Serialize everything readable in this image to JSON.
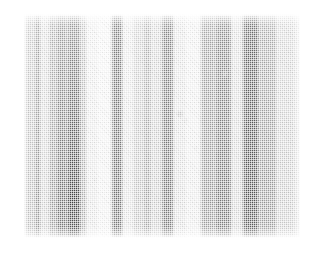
{
  "page": {
    "background_color": "#ffffff",
    "width": 315,
    "height": 265
  },
  "figure": {
    "kind": "scanned-gel-plate",
    "plate": {
      "x": 24,
      "y": 14,
      "width": 276,
      "height": 224,
      "paper_color": "#ffffff",
      "max_density_color": "#4a4a4a"
    },
    "texture": {
      "halftone": "orthogonal-dither-dot-screen",
      "dot_pitch_px": 2,
      "grain": "diagonal-cross-mottle",
      "streaking": "horizontal-scan-lines"
    }
  },
  "chart_data": {
    "type": "heatmap",
    "title": "",
    "subtitle": "",
    "xlabel": "",
    "ylabel": "",
    "orientation": "vertical-lanes",
    "grid": false,
    "legend": "none",
    "axis_labels_visible": false,
    "tick_labels_visible": false,
    "x": [
      24,
      300
    ],
    "xlim": [
      24,
      300
    ],
    "ylim": [
      14,
      238
    ],
    "intensity_scale": {
      "min": 0.0,
      "max": 1.0,
      "note": "0 = paper white, 1 = darkest halftone density"
    },
    "categories": [
      "band-01",
      "band-02",
      "band-03",
      "band-04",
      "band-05",
      "band-06",
      "band-07",
      "band-08",
      "band-09",
      "band-10",
      "band-11",
      "band-12",
      "band-13",
      "band-14",
      "band-15",
      "band-16",
      "band-17",
      "band-18",
      "band-19",
      "band-20",
      "band-21",
      "band-22",
      "band-23",
      "band-24"
    ],
    "values": [
      0.46,
      0.3,
      0.52,
      0.2,
      0.44,
      0.62,
      0.78,
      0.34,
      0.1,
      0.06,
      0.7,
      0.12,
      0.26,
      0.4,
      0.22,
      0.66,
      0.14,
      0.08,
      0.5,
      0.64,
      0.18,
      0.82,
      0.48,
      0.24
    ],
    "bands": [
      {
        "id": "band-01",
        "x": 24,
        "width": 7,
        "intensity": 0.46,
        "gradient_top": 0.4,
        "gradient_bottom": 0.5
      },
      {
        "id": "band-02",
        "x": 31,
        "width": 4,
        "intensity": 0.3,
        "gradient_top": 0.26,
        "gradient_bottom": 0.34
      },
      {
        "id": "band-03",
        "x": 35,
        "width": 6,
        "intensity": 0.52,
        "gradient_top": 0.46,
        "gradient_bottom": 0.56
      },
      {
        "id": "band-04",
        "x": 41,
        "width": 8,
        "intensity": 0.2,
        "gradient_top": 0.16,
        "gradient_bottom": 0.22
      },
      {
        "id": "band-05",
        "x": 49,
        "width": 7,
        "intensity": 0.44,
        "gradient_top": 0.38,
        "gradient_bottom": 0.5
      },
      {
        "id": "band-06",
        "x": 56,
        "width": 11,
        "intensity": 0.62,
        "gradient_top": 0.5,
        "gradient_bottom": 0.72
      },
      {
        "id": "band-07",
        "x": 67,
        "width": 14,
        "intensity": 0.78,
        "gradient_top": 0.56,
        "gradient_bottom": 0.94
      },
      {
        "id": "band-08",
        "x": 81,
        "width": 6,
        "intensity": 0.34,
        "gradient_top": 0.3,
        "gradient_bottom": 0.42
      },
      {
        "id": "band-09",
        "x": 87,
        "width": 12,
        "intensity": 0.1,
        "gradient_top": 0.08,
        "gradient_bottom": 0.12
      },
      {
        "id": "band-10",
        "x": 99,
        "width": 13,
        "intensity": 0.06,
        "gradient_top": 0.05,
        "gradient_bottom": 0.07
      },
      {
        "id": "band-11",
        "x": 112,
        "width": 11,
        "intensity": 0.7,
        "gradient_top": 0.66,
        "gradient_bottom": 0.72
      },
      {
        "id": "band-12",
        "x": 123,
        "width": 10,
        "intensity": 0.12,
        "gradient_top": 0.1,
        "gradient_bottom": 0.14
      },
      {
        "id": "band-13",
        "x": 133,
        "width": 10,
        "intensity": 0.26,
        "gradient_top": 0.22,
        "gradient_bottom": 0.3
      },
      {
        "id": "band-14",
        "x": 143,
        "width": 9,
        "intensity": 0.4,
        "gradient_top": 0.36,
        "gradient_bottom": 0.44
      },
      {
        "id": "band-15",
        "x": 152,
        "width": 10,
        "intensity": 0.22,
        "gradient_top": 0.2,
        "gradient_bottom": 0.26
      },
      {
        "id": "band-16",
        "x": 162,
        "width": 12,
        "intensity": 0.66,
        "gradient_top": 0.62,
        "gradient_bottom": 0.7
      },
      {
        "id": "band-17",
        "x": 174,
        "width": 13,
        "intensity": 0.14,
        "gradient_top": 0.12,
        "gradient_bottom": 0.16
      },
      {
        "id": "band-18",
        "x": 187,
        "width": 14,
        "intensity": 0.08,
        "gradient_top": 0.07,
        "gradient_bottom": 0.1
      },
      {
        "id": "band-19",
        "x": 201,
        "width": 14,
        "intensity": 0.5,
        "gradient_top": 0.46,
        "gradient_bottom": 0.52
      },
      {
        "id": "band-20",
        "x": 215,
        "width": 17,
        "intensity": 0.64,
        "gradient_top": 0.58,
        "gradient_bottom": 0.68
      },
      {
        "id": "band-21",
        "x": 232,
        "width": 11,
        "intensity": 0.18,
        "gradient_top": 0.16,
        "gradient_bottom": 0.2
      },
      {
        "id": "band-22",
        "x": 243,
        "width": 16,
        "intensity": 0.82,
        "gradient_top": 0.76,
        "gradient_bottom": 0.86
      },
      {
        "id": "band-23",
        "x": 259,
        "width": 18,
        "intensity": 0.48,
        "gradient_top": 0.42,
        "gradient_bottom": 0.52
      },
      {
        "id": "band-24",
        "x": 277,
        "width": 23,
        "intensity": 0.24,
        "gradient_top": 0.2,
        "gradient_bottom": 0.26
      }
    ],
    "blemishes": [
      {
        "id": "speck-1",
        "x": 68,
        "y": 66,
        "r": 3.2,
        "intensity": 0.55
      },
      {
        "id": "speck-2",
        "x": 95,
        "y": 180,
        "r": 2.0,
        "intensity": 0.3
      },
      {
        "id": "speck-3",
        "x": 180,
        "y": 114,
        "r": 3.6,
        "intensity": 0.42
      },
      {
        "id": "speck-4",
        "x": 186,
        "y": 120,
        "r": 2.4,
        "intensity": 0.36
      },
      {
        "id": "speck-5",
        "x": 225,
        "y": 74,
        "r": 4.0,
        "intensity": 0.34
      },
      {
        "id": "speck-6",
        "x": 196,
        "y": 148,
        "r": 2.2,
        "intensity": 0.28
      },
      {
        "id": "speck-7",
        "x": 145,
        "y": 228,
        "r": 2.6,
        "intensity": 0.38
      },
      {
        "id": "speck-8",
        "x": 60,
        "y": 44,
        "r": 2.8,
        "intensity": 0.4
      }
    ]
  }
}
